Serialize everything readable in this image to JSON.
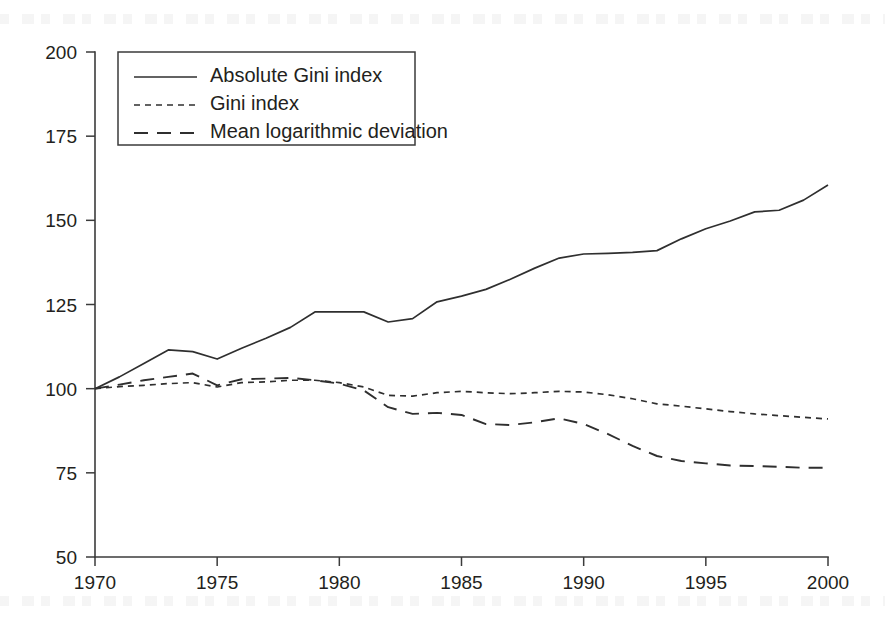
{
  "chart_data": {
    "type": "line",
    "title": "",
    "subtitle": "",
    "xlabel": "",
    "ylabel": "",
    "xlim": [
      1970,
      2000
    ],
    "ylim": [
      50,
      200
    ],
    "grid": false,
    "legend_position": "top-left",
    "x_ticks": [
      "1970",
      "1975",
      "1980",
      "1985",
      "1990",
      "1995",
      "2000"
    ],
    "x_tick_values": [
      1970,
      1975,
      1980,
      1985,
      1990,
      1995,
      2000
    ],
    "y_ticks": [
      "50",
      "75",
      "100",
      "125",
      "150",
      "175",
      "200"
    ],
    "y_tick_values": [
      50,
      75,
      100,
      125,
      150,
      175,
      200
    ],
    "x": [
      1970,
      1971,
      1972,
      1973,
      1974,
      1975,
      1976,
      1977,
      1978,
      1979,
      1980,
      1981,
      1982,
      1983,
      1984,
      1985,
      1986,
      1987,
      1988,
      1989,
      1990,
      1991,
      1992,
      1993,
      1994,
      1995,
      1996,
      1997,
      1998,
      1999,
      2000
    ],
    "series": [
      {
        "name": "Absolute Gini index",
        "style": "solid",
        "values": [
          100.0,
          103.5,
          107.5,
          111.5,
          111.0,
          108.8,
          112.0,
          115.0,
          118.2,
          122.8,
          122.8,
          122.8,
          119.8,
          120.8,
          125.8,
          127.5,
          129.5,
          132.5,
          135.8,
          138.8,
          140.0,
          140.2,
          140.5,
          141.0,
          144.5,
          147.5,
          149.8,
          152.5,
          153.0,
          156.0,
          160.5
        ]
      },
      {
        "name": "Gini index",
        "style": "dotted",
        "values": [
          100.0,
          100.6,
          101.0,
          101.5,
          101.8,
          100.5,
          101.8,
          102.0,
          102.5,
          102.5,
          101.8,
          100.5,
          98.0,
          97.8,
          98.8,
          99.2,
          98.8,
          98.5,
          98.8,
          99.2,
          99.0,
          98.2,
          97.0,
          95.5,
          94.8,
          94.0,
          93.2,
          92.5,
          92.0,
          91.5,
          91.0
        ]
      },
      {
        "name": "Mean logarithmic deviation",
        "style": "dashed",
        "values": [
          100.0,
          101.2,
          102.5,
          103.5,
          104.5,
          101.0,
          102.8,
          103.0,
          103.2,
          102.5,
          101.5,
          99.5,
          94.5,
          92.5,
          92.8,
          92.2,
          89.5,
          89.2,
          90.0,
          91.2,
          89.5,
          86.5,
          83.0,
          80.0,
          78.5,
          77.8,
          77.2,
          77.0,
          76.8,
          76.5,
          76.5
        ]
      }
    ],
    "legend": [
      {
        "label": "Absolute Gini index",
        "style": "solid"
      },
      {
        "label": "Gini index",
        "style": "dotted"
      },
      {
        "label": "Mean logarithmic deviation",
        "style": "dashed"
      }
    ],
    "colors": {
      "line": "#2f2f2f",
      "axis": "#3b3b3b",
      "text": "#231f20",
      "background": "#ffffff"
    }
  }
}
